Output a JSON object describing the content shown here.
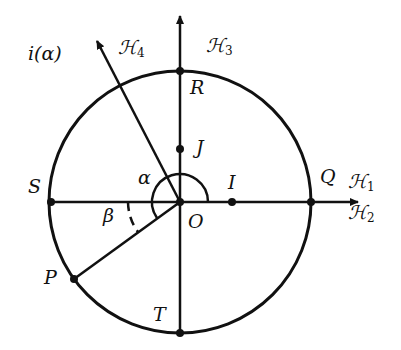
{
  "diagram": {
    "type": "unit circle with half-lines and angles",
    "stroke_color": "#111111",
    "background": "#ffffff",
    "points": {
      "O": "O",
      "I": "I",
      "J": "J",
      "R": "R",
      "S": "S",
      "T": "T",
      "Q": "Q",
      "P": "P"
    },
    "half_lines": {
      "H1": {
        "name": "ℋ",
        "sub": "1"
      },
      "H2": {
        "name": "ℋ",
        "sub": "2"
      },
      "H3": {
        "name": "ℋ",
        "sub": "3"
      },
      "H4": {
        "name": "ℋ",
        "sub": "4"
      }
    },
    "vector_label": "i(α)",
    "angles": {
      "alpha": "α",
      "beta": "β"
    }
  }
}
